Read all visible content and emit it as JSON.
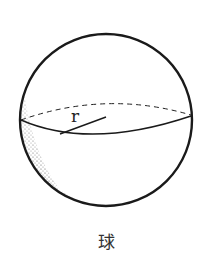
{
  "diagram": {
    "caption": "球",
    "radius_label": "r",
    "shape": "sphere",
    "colors": {
      "stroke": "#1a1a1a",
      "shading": "#555555",
      "background": "#ffffff"
    }
  }
}
